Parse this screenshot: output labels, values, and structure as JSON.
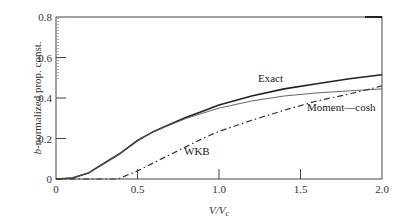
{
  "chart_data": {
    "type": "line",
    "title": "",
    "xlabel": "V/V_c",
    "ylabel": "b-normalized prop. const.",
    "xlim": [
      0,
      2.0
    ],
    "ylim": [
      0,
      0.8
    ],
    "xticks": [
      0,
      0.5,
      1.0,
      1.5,
      2.0
    ],
    "xtick_labels": [
      "0",
      "0.5",
      "1.0",
      "1.5",
      "2.0"
    ],
    "yticks": [
      0,
      0.2,
      0.4,
      0.6,
      0.8
    ],
    "ytick_labels": [
      "0",
      "0.2",
      "0.4",
      "0.6",
      "0.8"
    ],
    "grid": false,
    "legend_position": "inline labels",
    "series": [
      {
        "name": "Exact",
        "style": "solid-thick",
        "color": "#222222",
        "x": [
          0,
          0.1,
          0.2,
          0.3,
          0.4,
          0.5,
          0.6,
          0.7,
          0.8,
          0.9,
          1.0,
          1.2,
          1.4,
          1.6,
          1.8,
          2.0
        ],
        "values": [
          0,
          0.005,
          0.03,
          0.08,
          0.13,
          0.19,
          0.235,
          0.27,
          0.305,
          0.335,
          0.365,
          0.41,
          0.445,
          0.47,
          0.495,
          0.515
        ]
      },
      {
        "name": "Moment—cosh",
        "style": "solid-thin",
        "color": "#555555",
        "x": [
          0,
          0.1,
          0.2,
          0.3,
          0.4,
          0.5,
          0.6,
          0.7,
          0.8,
          0.9,
          1.0,
          1.2,
          1.4,
          1.6,
          1.8,
          2.0
        ],
        "values": [
          0,
          0.005,
          0.03,
          0.08,
          0.13,
          0.19,
          0.235,
          0.268,
          0.3,
          0.325,
          0.35,
          0.385,
          0.41,
          0.425,
          0.435,
          0.445
        ]
      },
      {
        "name": "WKB",
        "style": "dash-dot",
        "color": "#333333",
        "x": [
          0,
          0.38,
          0.5,
          0.6,
          0.7,
          0.8,
          0.9,
          1.0,
          1.2,
          1.4,
          1.6,
          1.8,
          2.0
        ],
        "values": [
          0,
          0,
          0.04,
          0.08,
          0.12,
          0.16,
          0.2,
          0.235,
          0.29,
          0.34,
          0.385,
          0.42,
          0.46
        ]
      }
    ],
    "annotations": [
      {
        "text": "Exact",
        "x": 1.25,
        "y": 0.5
      },
      {
        "text": "Moment—cosh",
        "x": 1.55,
        "y": 0.35
      },
      {
        "text": "WKB",
        "x": 0.78,
        "y": 0.14
      }
    ]
  },
  "labels": {
    "ylabel_prefix": "b",
    "ylabel_rest": "-normalized prop. const.",
    "xlabel_main": "V/V",
    "xlabel_sub": "c",
    "exact": "Exact",
    "moment": "Moment—cosh",
    "wkb": "WKB"
  }
}
